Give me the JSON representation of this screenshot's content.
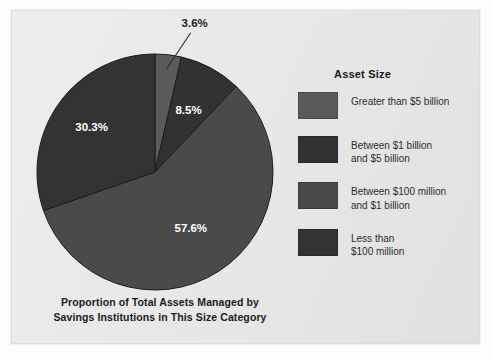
{
  "caption": {
    "line1": "Proportion of Total Assets Managed by",
    "line2": "Savings Institutions in This Size Category"
  },
  "legend": {
    "title": "Asset Size",
    "items": [
      {
        "label_line1": "Greater than $5 billion",
        "label_line2": "",
        "color": "#5a5a5a"
      },
      {
        "label_line1": "Between $1 billion",
        "label_line2": "and $5 billion",
        "color": "#323232"
      },
      {
        "label_line1": "Between $100 million",
        "label_line2": "and $1 billion",
        "color": "#4a4a4a"
      },
      {
        "label_line1": "Less than",
        "label_line2": "$100 million",
        "color": "#333333"
      }
    ]
  },
  "chart_data": {
    "type": "pie",
    "title": "Proportion of Total Assets Managed by Savings Institutions in This Size Category",
    "legend_title": "Asset Size",
    "legend_position": "right",
    "start_angle_deg": 0,
    "direction": "clockwise",
    "categories": [
      "Greater than $5 billion",
      "Between $1 billion and $5 billion",
      "Between $100 million and $1 billion",
      "Less than $100 million"
    ],
    "values": [
      3.6,
      8.5,
      57.6,
      30.3
    ],
    "value_labels": [
      "3.6%",
      "8.5%",
      "57.6%",
      "30.3%"
    ],
    "colors": [
      "#5a5a5a",
      "#323232",
      "#4a4a4a",
      "#333333"
    ],
    "label_placement": [
      "callout",
      "inside",
      "inside",
      "inside"
    ],
    "units": "percent"
  },
  "geometry": {
    "center_x": 144,
    "center_y": 162,
    "radius": 118
  }
}
